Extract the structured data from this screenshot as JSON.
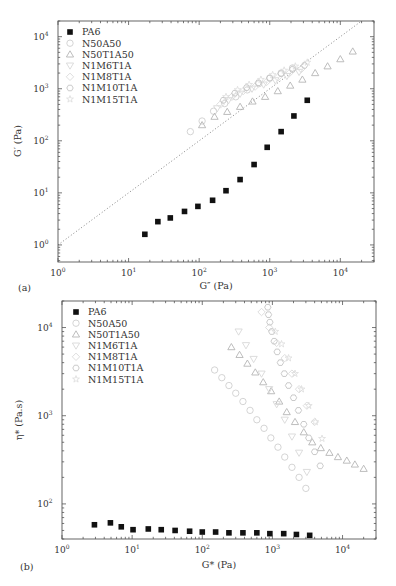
{
  "chart_data": [
    {
      "panel": "(a)",
      "type": "scatter",
      "xscale": "log",
      "yscale": "log",
      "xlabel": "G″ (Pa)",
      "ylabel": "G′ (Pa)",
      "xlim": [
        1,
        30000
      ],
      "ylim": [
        0.47,
        20000
      ],
      "xticks": [
        {
          "base": "10",
          "exp": "0",
          "value": 1
        },
        {
          "base": "10",
          "exp": "1",
          "value": 10
        },
        {
          "base": "10",
          "exp": "2",
          "value": 100
        },
        {
          "base": "10",
          "exp": "3",
          "value": 1000
        },
        {
          "base": "10",
          "exp": "4",
          "value": 10000
        }
      ],
      "yticks": [
        {
          "base": "10",
          "exp": "0",
          "value": 1
        },
        {
          "base": "10",
          "exp": "1",
          "value": 10
        },
        {
          "base": "10",
          "exp": "2",
          "value": 100
        },
        {
          "base": "10",
          "exp": "3",
          "value": 1000
        },
        {
          "base": "10",
          "exp": "4",
          "value": 10000
        }
      ],
      "reference_line": {
        "type": "dotted",
        "label": "G′ = G″",
        "from": [
          1,
          1
        ],
        "to": [
          30000,
          30000
        ]
      },
      "legend_position": "top-left",
      "series": [
        {
          "name": "PA6",
          "marker": "filled-square",
          "color": "#111111",
          "x": [
            17,
            26,
            39,
            62,
            96,
            155,
            240,
            380,
            600,
            920,
            1450,
            2200,
            3400
          ],
          "y": [
            1.6,
            2.8,
            3.3,
            4.4,
            5.5,
            7.2,
            11,
            18,
            35,
            75,
            150,
            300,
            600
          ]
        },
        {
          "name": "N50A50",
          "marker": "open-circle",
          "color": "#cfcfcf",
          "x": [
            75,
            110,
            160,
            230,
            330,
            480,
            700,
            1000,
            1450,
            2100
          ],
          "y": [
            150,
            240,
            370,
            520,
            700,
            950,
            1250,
            1600,
            2000,
            2500
          ]
        },
        {
          "name": "N50T1A50",
          "marker": "open-triangle-up",
          "color": "#b5b5b5",
          "x": [
            110,
            165,
            250,
            380,
            570,
            860,
            1300,
            1950,
            2900,
            4400,
            6600,
            10000,
            15000
          ],
          "y": [
            200,
            290,
            360,
            450,
            570,
            700,
            900,
            1150,
            1500,
            2000,
            2700,
            3700,
            5200
          ]
        },
        {
          "name": "N1M6T1A",
          "marker": "open-triangle-down",
          "color": "#d8d8d8",
          "x": [
            180,
            260,
            380,
            560,
            820,
            1200,
            1750,
            2600
          ],
          "y": [
            420,
            600,
            800,
            1000,
            1200,
            1450,
            1750,
            2100
          ]
        },
        {
          "name": "N1M8T1A",
          "marker": "open-diamond",
          "color": "#dadada",
          "x": [
            200,
            290,
            420,
            620,
            900,
            1300,
            1900,
            2800
          ],
          "y": [
            500,
            700,
            900,
            1100,
            1350,
            1650,
            2000,
            2400
          ]
        },
        {
          "name": "N1M10T1A",
          "marker": "open-hexagon",
          "color": "#c4c4c4",
          "x": [
            220,
            320,
            470,
            690,
            1000,
            1450,
            2100,
            3100
          ],
          "y": [
            600,
            820,
            1050,
            1300,
            1600,
            1950,
            2350,
            2800
          ]
        },
        {
          "name": "N1M15T1A",
          "marker": "open-star",
          "color": "#dcdcdc",
          "x": [
            240,
            350,
            510,
            750,
            1100,
            1600,
            2300,
            3400
          ],
          "y": [
            700,
            950,
            1200,
            1500,
            1850,
            2250,
            2700,
            3200
          ]
        }
      ]
    },
    {
      "panel": "(b)",
      "type": "scatter",
      "xscale": "log",
      "yscale": "log",
      "xlabel": "G* (Pa)",
      "ylabel": "η* (Pa.s)",
      "xlim": [
        1,
        30000
      ],
      "ylim": [
        40,
        20000
      ],
      "xticks": [
        {
          "base": "10",
          "exp": "0",
          "value": 1
        },
        {
          "base": "10",
          "exp": "1",
          "value": 10
        },
        {
          "base": "10",
          "exp": "2",
          "value": 100
        },
        {
          "base": "10",
          "exp": "3",
          "value": 1000
        },
        {
          "base": "10",
          "exp": "4",
          "value": 10000
        }
      ],
      "yticks": [
        {
          "base": "10",
          "exp": "2",
          "value": 100
        },
        {
          "base": "10",
          "exp": "3",
          "value": 1000
        },
        {
          "base": "10",
          "exp": "4",
          "value": 10000
        }
      ],
      "legend_position": "top-left",
      "series": [
        {
          "name": "PA6",
          "marker": "filled-square",
          "color": "#111111",
          "x": [
            2.9,
            4.9,
            7.0,
            10.3,
            17,
            26,
            41,
            66,
            100,
            155,
            240,
            380,
            600,
            920,
            1450,
            2200,
            3400
          ],
          "y": [
            58,
            61,
            55,
            51,
            52,
            51,
            50,
            49,
            48,
            48,
            47,
            47,
            47,
            46,
            46,
            45,
            44
          ]
        },
        {
          "name": "N50A50",
          "marker": "open-circle",
          "color": "#cfcfcf",
          "x": [
            150,
            190,
            240,
            300,
            380,
            480,
            600,
            760,
            950,
            1200,
            1500,
            1900,
            2400,
            3000
          ],
          "y": [
            3300,
            2700,
            2200,
            1800,
            1450,
            1150,
            900,
            720,
            560,
            440,
            340,
            260,
            200,
            150
          ]
        },
        {
          "name": "N50T1A50",
          "marker": "open-triangle-up",
          "color": "#b5b5b5",
          "x": [
            260,
            340,
            440,
            570,
            740,
            960,
            1250,
            1600,
            2100,
            2800,
            3700,
            4900,
            6500,
            8600,
            11500,
            15000,
            20000
          ],
          "y": [
            6000,
            4900,
            3900,
            3100,
            2400,
            1900,
            1450,
            1100,
            850,
            650,
            500,
            430,
            380,
            340,
            310,
            280,
            250
          ]
        },
        {
          "name": "N1M6T1A",
          "marker": "open-triangle-down",
          "color": "#d8d8d8",
          "x": [
            330,
            420,
            540,
            700,
            900,
            1150,
            1500,
            1900,
            2400,
            3100
          ],
          "y": [
            9000,
            6300,
            4400,
            3000,
            2000,
            1350,
            900,
            580,
            380,
            230
          ]
        },
        {
          "name": "N1M8T1A",
          "marker": "open-diamond",
          "color": "#dadada",
          "x": [
            700,
            900,
            1150,
            1500,
            1900,
            2400,
            3100,
            4000
          ],
          "y": [
            15000,
            10000,
            6700,
            4500,
            3000,
            2000,
            1300,
            850
          ]
        },
        {
          "name": "N1M10T1A",
          "marker": "open-hexagon",
          "color": "#c4c4c4",
          "x": [
            860,
            880,
            920,
            980,
            1060,
            1170,
            1300,
            1480,
            1700,
            2000,
            2350,
            2800,
            3300,
            4000,
            4800
          ],
          "y": [
            17000,
            14000,
            11500,
            9000,
            7000,
            5300,
            4000,
            3000,
            2200,
            1600,
            1150,
            800,
            560,
            390,
            270
          ]
        },
        {
          "name": "N1M15T1A",
          "marker": "open-star",
          "color": "#dcdcdc",
          "x": [
            1100,
            1350,
            1700,
            2100,
            2600,
            3300,
            4100,
            5100
          ],
          "y": [
            9000,
            6500,
            4500,
            3000,
            2000,
            1300,
            850,
            550
          ]
        }
      ]
    }
  ]
}
